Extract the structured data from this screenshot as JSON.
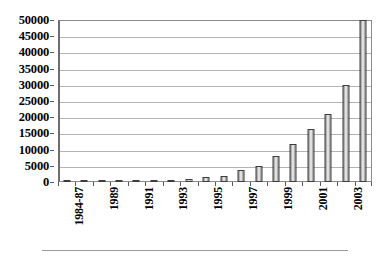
{
  "chart_data": {
    "type": "bar",
    "title": "",
    "subtitle": "",
    "xlabel": "",
    "ylabel": "",
    "ylim": [
      0,
      50000
    ],
    "ytick_step": 5000,
    "grid": true,
    "legend": null,
    "legend_position": "none",
    "categories": [
      "1984-87",
      "1988",
      "1989",
      "1990",
      "1991",
      "1992",
      "1993",
      "1994",
      "1995",
      "1996",
      "1997",
      "1998",
      "1999",
      "2000",
      "2001",
      "2002",
      "2003",
      "2004"
    ],
    "tick_labels_shown": [
      "1984-87",
      "",
      "1989",
      "",
      "1991",
      "",
      "1993",
      "",
      "1995",
      "",
      "1997",
      "",
      "1999",
      "",
      "2001",
      "",
      "2003",
      ""
    ],
    "values": [
      100,
      120,
      150,
      180,
      250,
      300,
      350,
      900,
      1400,
      1900,
      3600,
      5000,
      8000,
      11700,
      16300,
      21000,
      30000,
      50000
    ],
    "ytick_labels": [
      "50000",
      "45000",
      "40000",
      "35000",
      "30000",
      "25000",
      "20000",
      "15000",
      "10000",
      "5000",
      "0"
    ],
    "ytick_values": [
      50000,
      45000,
      40000,
      35000,
      30000,
      25000,
      20000,
      15000,
      10000,
      5000,
      0
    ],
    "colors": {
      "bar_fill": "#c9c9c9",
      "bar_edge": "#3d3d3d",
      "gridline": "#b4b4b4",
      "axis": "#6e6e6e",
      "text": "#000000"
    }
  }
}
